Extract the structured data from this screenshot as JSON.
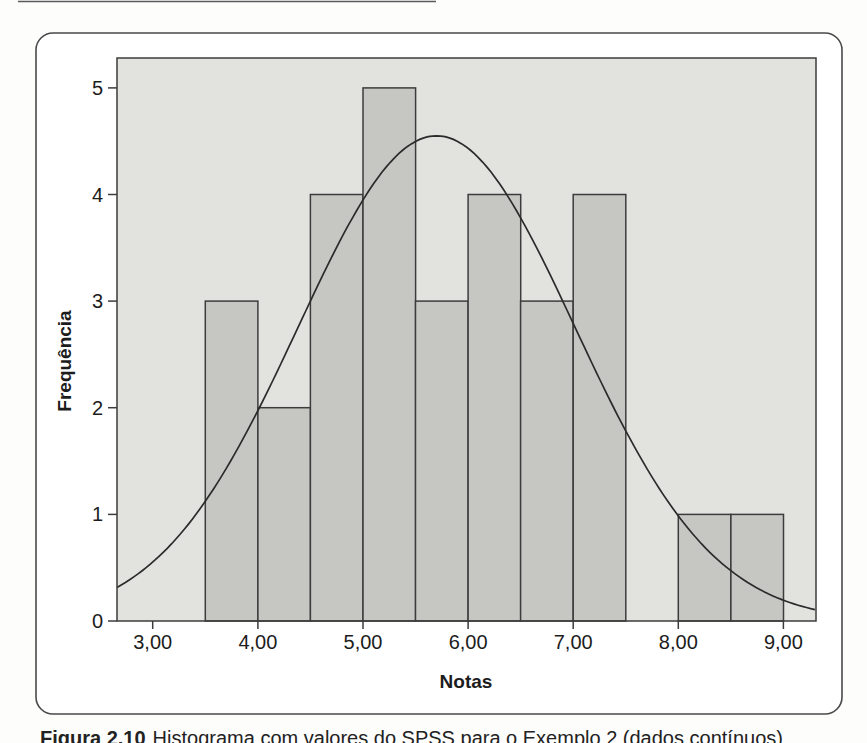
{
  "figure": {
    "caption_prefix": "Figura 2.10",
    "caption_text": "Histograma com valores do SPSS para o Exemplo 2 (dados contínuos)"
  },
  "chart_data": {
    "type": "bar",
    "subtype": "histogram-with-normal-curve",
    "title": "",
    "xlabel": "Notas",
    "ylabel": "Frequência",
    "bin_width": 0.5,
    "bins": [
      {
        "start": 3.5,
        "end": 4.0,
        "count": 3
      },
      {
        "start": 4.0,
        "end": 4.5,
        "count": 2
      },
      {
        "start": 4.5,
        "end": 5.0,
        "count": 4
      },
      {
        "start": 5.0,
        "end": 5.5,
        "count": 5
      },
      {
        "start": 5.5,
        "end": 6.0,
        "count": 3
      },
      {
        "start": 6.0,
        "end": 6.5,
        "count": 4
      },
      {
        "start": 6.5,
        "end": 7.0,
        "count": 3
      },
      {
        "start": 7.0,
        "end": 7.5,
        "count": 4
      },
      {
        "start": 7.5,
        "end": 8.0,
        "count": 0
      },
      {
        "start": 8.0,
        "end": 8.5,
        "count": 1
      },
      {
        "start": 8.5,
        "end": 9.0,
        "count": 1
      }
    ],
    "total_n": 30,
    "x_ticks": [
      {
        "value": 3,
        "label": "3,00"
      },
      {
        "value": 4,
        "label": "4,00"
      },
      {
        "value": 5,
        "label": "5,00"
      },
      {
        "value": 6,
        "label": "6,00"
      },
      {
        "value": 7,
        "label": "7,00"
      },
      {
        "value": 8,
        "label": "8,00"
      },
      {
        "value": 9,
        "label": "9,00"
      }
    ],
    "y_ticks": [
      0,
      1,
      2,
      3,
      4,
      5
    ],
    "xlim": [
      2.66,
      9.31
    ],
    "ylim": [
      0,
      5.28
    ],
    "grid": false,
    "legend": false,
    "normal_curve": {
      "mean": 5.7,
      "sd": 1.315,
      "peak_height": 4.55
    },
    "colors": {
      "panel_background": "#e2e2df",
      "bar_fill": "#c6c6c3",
      "bar_stroke": "#3c3c3c",
      "curve": "#2b2b2b",
      "text": "#1c1c1c",
      "border": "#4a4a4a"
    }
  }
}
